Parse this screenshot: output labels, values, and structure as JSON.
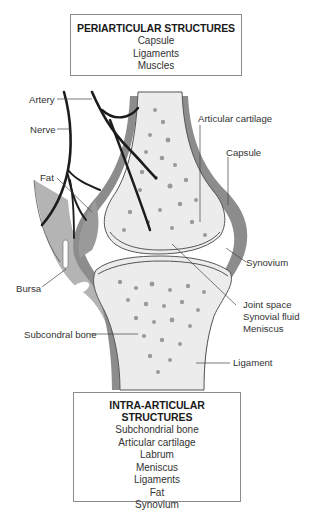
{
  "periarticular": {
    "title": "PERIARTICULAR STRUCTURES",
    "items": [
      "Capsule",
      "Ligaments",
      "Muscles"
    ]
  },
  "intraarticular": {
    "title": "INTRA-ARTICULAR STRUCTURES",
    "items": [
      "Subchondrial bone",
      "Articular cartilage",
      "Labrum",
      "Meniscus",
      "Ligaments",
      "Fat",
      "Synovium"
    ]
  },
  "labels": {
    "artery": "Artery",
    "nerve": "Nerve",
    "fat": "Fat",
    "bursa": "Bursa",
    "subchondral_bone": "Subcondral bone",
    "articular_cartilage": "Articular cartilage",
    "capsule": "Capsule",
    "synovium": "Synovium",
    "joint_space": "Joint space",
    "synovial_fluid": "Synovial fluid",
    "meniscus": "Meniscus",
    "ligament": "Ligament"
  },
  "colors": {
    "bone": "#eeeeee",
    "capsule": "#8c8c8c",
    "soft_tissue": "#b4b4b4",
    "vessel": "#1c1c1c",
    "box_border": "#8a8a8a"
  }
}
